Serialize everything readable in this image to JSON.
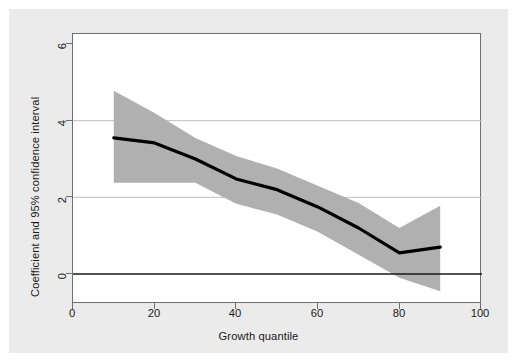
{
  "figure": {
    "background_color": "#ebebeb",
    "plot_background_color": "#ffffff",
    "frame_color": "#6f6f6f"
  },
  "chart_data": {
    "type": "line",
    "title": "",
    "subtitle": "",
    "xlabel": "Growth quantile",
    "ylabel": "Coefficient and 95% confidence interval",
    "xlim": [
      0,
      100
    ],
    "ylim": [
      -1.2,
      6.6
    ],
    "xticks": [
      0,
      20,
      40,
      60,
      80,
      100
    ],
    "yticks": [
      0,
      2,
      4,
      6
    ],
    "xtick_labels": [
      "0",
      "20",
      "40",
      "60",
      "80",
      "100"
    ],
    "ytick_labels": [
      "0",
      "2",
      "4",
      "6"
    ],
    "grid": "horizontal-gridlines-at-2-and-4",
    "gridline_color": "#bfbfbf",
    "zero_line": 0,
    "zero_line_color": "#1a1a1a",
    "legend": "none",
    "band_color": "#b0b0b0",
    "line_color": "#000000",
    "x": [
      10,
      20,
      30,
      40,
      50,
      60,
      70,
      80,
      90
    ],
    "series": [
      {
        "name": "Coefficient",
        "values": [
          3.55,
          3.42,
          3.0,
          2.48,
          2.2,
          1.75,
          1.2,
          0.55,
          0.7
        ]
      },
      {
        "name": "95% CI upper",
        "values": [
          4.78,
          4.2,
          3.55,
          3.08,
          2.75,
          2.3,
          1.85,
          1.2,
          1.78
        ]
      },
      {
        "name": "95% CI lower",
        "values": [
          2.38,
          2.38,
          2.38,
          1.83,
          1.55,
          1.1,
          0.5,
          -0.1,
          -0.45
        ]
      }
    ]
  }
}
